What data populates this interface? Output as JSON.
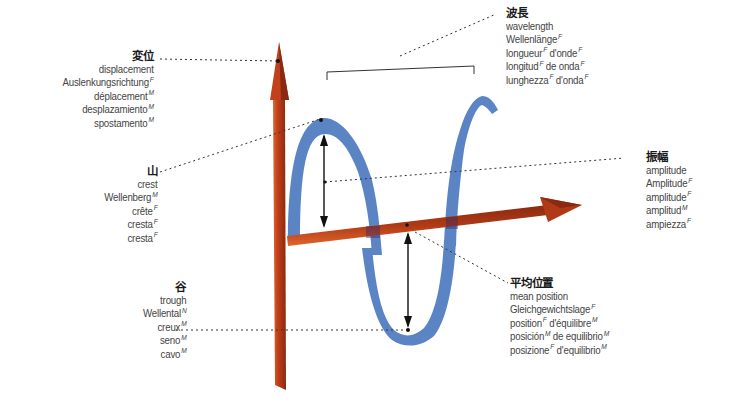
{
  "diagram": {
    "type": "multilingual-visual-dictionary",
    "subject": "wave",
    "colors": {
      "axis_orange": "#c2401a",
      "axis_dark": "#8a2a10",
      "wave_blue": "#5b84c4",
      "wave_blue_dark": "#456fb0",
      "text": "#444444",
      "leader_line": "#333333"
    }
  },
  "labels": {
    "displacement": {
      "heading": "変位",
      "terms": [
        {
          "text": "displacement",
          "gender": ""
        },
        {
          "text": "Auslenkungsrichtung",
          "gender": "F"
        },
        {
          "text": "déplacement",
          "gender": "M"
        },
        {
          "text": "desplazamiento",
          "gender": "M"
        },
        {
          "text": "spostamento",
          "gender": "M"
        }
      ]
    },
    "crest": {
      "heading": "山",
      "terms": [
        {
          "text": "crest",
          "gender": ""
        },
        {
          "text": "Wellenberg",
          "gender": "M"
        },
        {
          "text": "crête",
          "gender": "F"
        },
        {
          "text": "cresta",
          "gender": "F"
        },
        {
          "text": "cresta",
          "gender": "F"
        }
      ]
    },
    "trough": {
      "heading": "谷",
      "terms": [
        {
          "text": "trough",
          "gender": ""
        },
        {
          "text": "Wellental",
          "gender": "N"
        },
        {
          "text": "creux",
          "gender": "M"
        },
        {
          "text": "seno",
          "gender": "M"
        },
        {
          "text": "cavo",
          "gender": "M"
        }
      ]
    },
    "wavelength": {
      "heading": "波長",
      "terms": [
        {
          "text": "wavelength",
          "gender": ""
        },
        {
          "text": "Wellenlänge",
          "gender": "F"
        },
        {
          "text": "longueur",
          "gender": "F",
          "text2": " d'onde",
          "gender2": "F"
        },
        {
          "text": "longitud",
          "gender": "F",
          "text2": " de onda",
          "gender2": "F"
        },
        {
          "text": "lunghezza",
          "gender": "F",
          "text2": " d'onda",
          "gender2": "F"
        }
      ]
    },
    "amplitude": {
      "heading": "振幅",
      "terms": [
        {
          "text": "amplitude",
          "gender": ""
        },
        {
          "text": "Amplitude",
          "gender": "F"
        },
        {
          "text": "amplitude",
          "gender": "F"
        },
        {
          "text": "amplitud",
          "gender": "M"
        },
        {
          "text": "ampiezza",
          "gender": "F"
        }
      ]
    },
    "mean_position": {
      "heading": "平均位置",
      "terms": [
        {
          "text": "mean position",
          "gender": ""
        },
        {
          "text": "Gleichgewichtslage",
          "gender": "F"
        },
        {
          "text": "position",
          "gender": "F",
          "text2": " d'équilibre",
          "gender2": "M"
        },
        {
          "text": "posición",
          "gender": "M",
          "text2": " de equilibrio",
          "gender2": "M"
        },
        {
          "text": "posizione",
          "gender": "F",
          "text2": " d'equilibrio",
          "gender2": "M"
        }
      ]
    }
  }
}
